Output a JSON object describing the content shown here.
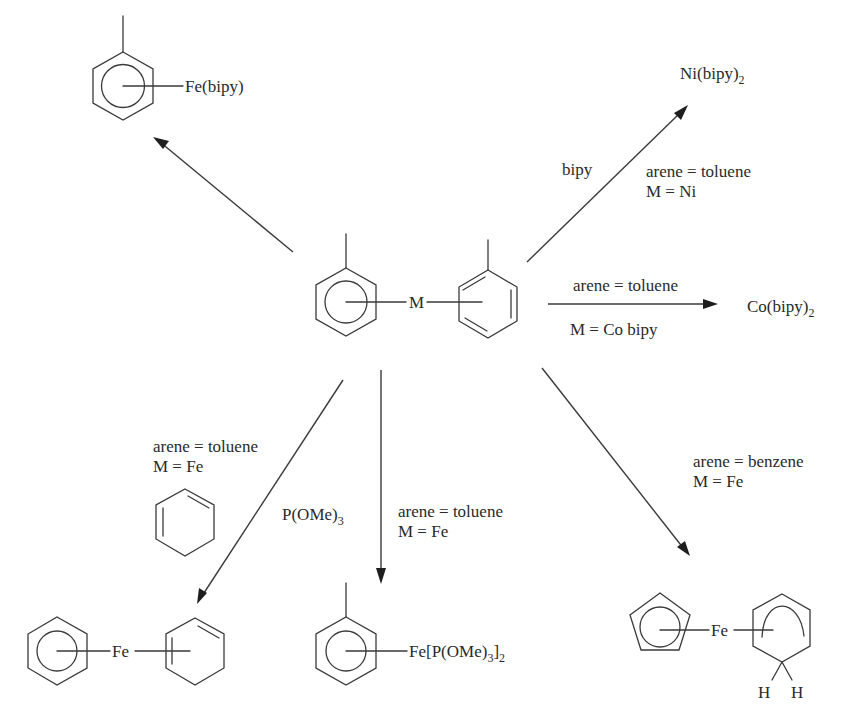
{
  "figure": {
    "type": "reaction-scheme",
    "background": "#ffffff",
    "line_color": "#3a3a3a"
  },
  "center_complex": {
    "metal_label": "M",
    "left_ligand": "toluene (eta6, delocalized ring)",
    "right_ligand": "toluene (eta6, Kekulé ring)"
  },
  "products": {
    "top_left": {
      "metal_label": "Fe(bipy)",
      "arene": "toluene"
    },
    "top_right": {
      "formula_main": "Ni(bipy)",
      "formula_sub": "2"
    },
    "right": {
      "formula_main": "Co(bipy)",
      "formula_sub": "2"
    },
    "bottom_left": {
      "metal_label": "Fe",
      "left_ligand": "benzene",
      "right_ligand": "cyclohexadiene"
    },
    "bottom_center": {
      "metal_prefix": "Fe[P(OMe)",
      "sub1": "3",
      "bracket": "]",
      "sub2": "2",
      "arene": "toluene"
    },
    "bottom_right": {
      "metal_label": "Fe",
      "h1": "H",
      "h2": "H",
      "left_ligand": "cyclopentadienyl",
      "right_ligand": "cyclohexadienyl"
    }
  },
  "conditions": {
    "to_top_right": {
      "reagent": "bipy",
      "line1": "arene = toluene",
      "line2": "M = Ni"
    },
    "to_right": {
      "line_above": "arene = toluene",
      "line_below": "M = Co bipy"
    },
    "to_bottom_left": {
      "line1": "arene = toluene",
      "line2": "M = Fe",
      "reagent_structure": "1,3-cyclohexadiene"
    },
    "to_bottom_center": {
      "reagent_main": "P(OMe)",
      "reagent_sub": "3",
      "line1": "arene = toluene",
      "line2": "M = Fe"
    },
    "to_bottom_right": {
      "line1": "arene = benzene",
      "line2": "M = Fe"
    }
  },
  "arrows": [
    {
      "name": "arrow-to-top-left",
      "from": [
        293,
        252
      ],
      "to": [
        153,
        137
      ]
    },
    {
      "name": "arrow-to-top-right",
      "from": [
        527,
        262
      ],
      "to": [
        688,
        105
      ]
    },
    {
      "name": "arrow-to-right",
      "from": [
        548,
        304
      ],
      "to": [
        718,
        304
      ]
    },
    {
      "name": "arrow-to-bottom-left",
      "from": [
        343,
        380
      ],
      "to": [
        197,
        604
      ]
    },
    {
      "name": "arrow-to-bottom-center",
      "from": [
        381,
        370
      ],
      "to": [
        381,
        584
      ]
    },
    {
      "name": "arrow-to-bottom-right",
      "from": [
        542,
        368
      ],
      "to": [
        690,
        556
      ]
    }
  ]
}
